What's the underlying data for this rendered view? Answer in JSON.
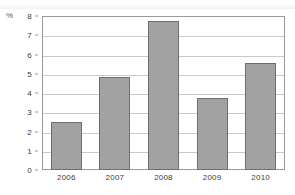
{
  "chart_data": {
    "type": "bar",
    "title": "",
    "subtitle": "",
    "xlabel": "",
    "ylabel": "%",
    "categories": [
      "2006",
      "2007",
      "2008",
      "2009",
      "2010"
    ],
    "values": [
      2.5,
      4.85,
      7.75,
      3.75,
      5.55
    ],
    "series": [
      {
        "name": "",
        "values": [
          2.5,
          4.85,
          7.75,
          3.75,
          5.55
        ]
      }
    ],
    "ylim": [
      0,
      8
    ],
    "ytick_labels": [
      "8",
      "7",
      "6",
      "5",
      "4",
      "3",
      "2",
      "1",
      "0"
    ],
    "ytick_values": [
      8,
      7,
      6,
      5,
      4,
      3,
      2,
      1,
      0
    ],
    "grid": true,
    "grid_axis": "y",
    "legend": false,
    "legend_position": "none",
    "bar_fill_color": "#a2a2a2",
    "bar_border_color": "#6e6e6e",
    "gridline_color": "#c9c9c9",
    "axis_border_color": "#9a9a9a",
    "text_color": "#3d3d3d"
  }
}
